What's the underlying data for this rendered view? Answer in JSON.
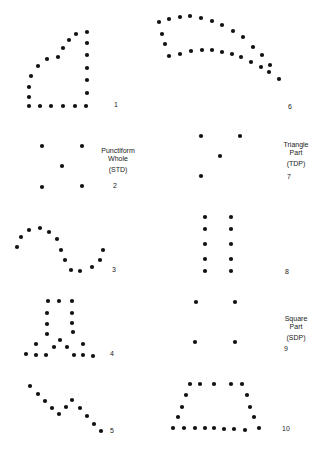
{
  "dot_color": "#111111",
  "figures": [
    {
      "number": "1",
      "points": [
        [
          29,
          106
        ],
        [
          40,
          106
        ],
        [
          51,
          106
        ],
        [
          63,
          106
        ],
        [
          75,
          106
        ],
        [
          86,
          106
        ],
        [
          87,
          93
        ],
        [
          87,
          80
        ],
        [
          87,
          68
        ],
        [
          87,
          55
        ],
        [
          87,
          43
        ],
        [
          87,
          32
        ],
        [
          76,
          34
        ],
        [
          69,
          40
        ],
        [
          63,
          48
        ],
        [
          58,
          57
        ],
        [
          47,
          59
        ],
        [
          38,
          66
        ],
        [
          31,
          76
        ],
        [
          29,
          87
        ],
        [
          29,
          97
        ]
      ]
    },
    {
      "number": "2",
      "points": [
        [
          42,
          146
        ],
        [
          82,
          146
        ],
        [
          62,
          166
        ],
        [
          42,
          187
        ],
        [
          82,
          186
        ]
      ],
      "caption": [
        "Punctiform",
        "Whole",
        "(STD)"
      ]
    },
    {
      "number": "3",
      "points": [
        [
          17,
          247
        ],
        [
          21,
          237
        ],
        [
          29,
          230
        ],
        [
          40,
          228
        ],
        [
          49,
          232
        ],
        [
          57,
          239
        ],
        [
          61,
          250
        ],
        [
          65,
          260
        ],
        [
          71,
          270
        ],
        [
          80,
          271
        ],
        [
          92,
          267
        ],
        [
          100,
          260
        ],
        [
          103,
          250
        ]
      ]
    },
    {
      "number": "4",
      "points": [
        [
          48,
          301
        ],
        [
          59,
          301
        ],
        [
          72,
          301
        ],
        [
          47,
          313
        ],
        [
          47,
          324
        ],
        [
          47,
          334
        ],
        [
          72,
          313
        ],
        [
          72,
          323
        ],
        [
          73,
          332
        ],
        [
          60,
          340
        ],
        [
          36,
          344
        ],
        [
          54,
          347
        ],
        [
          67,
          347
        ],
        [
          83,
          344
        ],
        [
          26,
          354
        ],
        [
          36,
          355
        ],
        [
          46,
          355
        ],
        [
          74,
          355
        ],
        [
          83,
          355
        ],
        [
          93,
          356
        ]
      ]
    },
    {
      "number": "5",
      "points": [
        [
          30,
          386
        ],
        [
          38,
          394
        ],
        [
          45,
          401
        ],
        [
          52,
          408
        ],
        [
          59,
          414
        ],
        [
          66,
          407
        ],
        [
          72,
          400
        ],
        [
          80,
          408
        ],
        [
          87,
          416
        ],
        [
          94,
          424
        ],
        [
          101,
          431
        ]
      ]
    },
    {
      "number": "6",
      "points": [
        [
          159,
          22
        ],
        [
          169,
          19
        ],
        [
          180,
          17
        ],
        [
          190,
          16
        ],
        [
          201,
          18
        ],
        [
          212,
          21
        ],
        [
          222,
          25
        ],
        [
          233,
          31
        ],
        [
          243,
          37
        ],
        [
          253,
          47
        ],
        [
          262,
          55
        ],
        [
          270,
          65
        ],
        [
          269,
          72
        ],
        [
          279,
          79
        ],
        [
          162,
          34
        ],
        [
          165,
          44
        ],
        [
          169,
          56
        ],
        [
          180,
          54
        ],
        [
          191,
          51
        ],
        [
          202,
          50
        ],
        [
          212,
          50
        ],
        [
          222,
          52
        ],
        [
          232,
          54
        ],
        [
          241,
          57
        ],
        [
          251,
          62
        ],
        [
          261,
          67
        ]
      ]
    },
    {
      "number": "7",
      "points": [
        [
          201,
          136
        ],
        [
          240,
          136
        ],
        [
          220,
          156
        ],
        [
          201,
          176
        ]
      ],
      "caption": [
        "Triangle",
        "Part",
        "(TDP)"
      ]
    },
    {
      "number": "8",
      "points": [
        [
          205,
          217
        ],
        [
          205,
          229
        ],
        [
          205,
          244
        ],
        [
          205,
          259
        ],
        [
          205,
          271
        ],
        [
          231,
          217
        ],
        [
          231,
          229
        ],
        [
          231,
          244
        ],
        [
          231,
          259
        ],
        [
          231,
          271
        ]
      ]
    },
    {
      "number": "9",
      "points": [
        [
          196,
          302
        ],
        [
          235,
          302
        ],
        [
          195,
          342
        ],
        [
          235,
          342
        ]
      ],
      "caption": [
        "Square",
        "Part",
        "(SDP)"
      ]
    },
    {
      "number": "10",
      "points": [
        [
          190,
          384
        ],
        [
          200,
          384
        ],
        [
          214,
          384
        ],
        [
          231,
          384
        ],
        [
          242,
          384
        ],
        [
          186,
          395
        ],
        [
          182,
          407
        ],
        [
          178,
          417
        ],
        [
          247,
          395
        ],
        [
          250,
          407
        ],
        [
          254,
          417
        ],
        [
          173,
          428
        ],
        [
          184,
          428
        ],
        [
          195,
          428
        ],
        [
          205,
          428
        ],
        [
          214,
          428
        ],
        [
          224,
          429
        ],
        [
          234,
          429
        ],
        [
          245,
          430
        ],
        [
          259,
          428
        ]
      ]
    }
  ]
}
